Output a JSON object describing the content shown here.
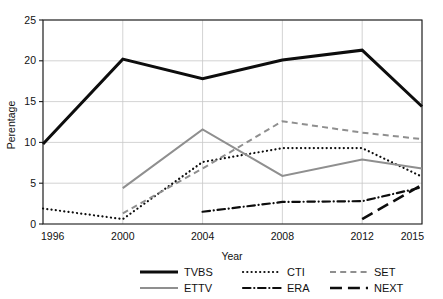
{
  "chart_data": {
    "type": "line",
    "title": "",
    "xlabel": "Year",
    "ylabel": "Perentage",
    "x": [
      1996,
      2000,
      2004,
      2008,
      2012,
      2015
    ],
    "categories": [
      "1996",
      "2000",
      "2004",
      "2008",
      "2012",
      "2015"
    ],
    "xticklabels": [
      "1996",
      "2000",
      "2004",
      "2008",
      "2012",
      "2015"
    ],
    "yticklabels": [
      "0",
      "5",
      "10",
      "15",
      "20",
      "25"
    ],
    "yticks": [
      0,
      5,
      10,
      15,
      20,
      25
    ],
    "xlim": [
      1996,
      2015
    ],
    "ylim": [
      0,
      25
    ],
    "grid": true,
    "legend_position": "below",
    "series": [
      {
        "name": "TVBS",
        "color": "#0d0d0d",
        "style": "solid",
        "width": 3.0,
        "x": [
          1996,
          2000,
          2004,
          2008,
          2012,
          2015
        ],
        "values": [
          9.8,
          20.2,
          17.8,
          20.1,
          21.3,
          14.4
        ]
      },
      {
        "name": "CTI",
        "color": "#0d0d0d",
        "style": "dotted",
        "width": 2.2,
        "x": [
          1996,
          2000,
          2004,
          2008,
          2012,
          2015
        ],
        "values": [
          1.9,
          0.6,
          7.6,
          9.3,
          9.3,
          5.8
        ]
      },
      {
        "name": "SET",
        "color": "#8f8f8f",
        "style": "dashed",
        "width": 2.0,
        "x": [
          2000,
          2004,
          2008,
          2012,
          2015
        ],
        "values": [
          1.3,
          6.8,
          12.6,
          11.2,
          10.4
        ]
      },
      {
        "name": "ETTV",
        "color": "#8f8f8f",
        "style": "solid",
        "width": 2.0,
        "x": [
          2000,
          2004,
          2008,
          2012,
          2015
        ],
        "values": [
          4.4,
          11.6,
          5.9,
          7.9,
          6.8
        ]
      },
      {
        "name": "ERA",
        "color": "#0d0d0d",
        "style": "dashdot",
        "width": 2.2,
        "x": [
          2004,
          2008,
          2012,
          2015
        ],
        "values": [
          1.5,
          2.7,
          2.8,
          4.5
        ]
      },
      {
        "name": "NEXT",
        "color": "#0d0d0d",
        "style": "longdash",
        "width": 2.6,
        "x": [
          2012,
          2015
        ],
        "values": [
          0.6,
          4.8
        ]
      }
    ]
  },
  "legend": {
    "rows": [
      [
        {
          "label": "TVBS",
          "key": "TVBS"
        },
        {
          "label": "CTI",
          "key": "CTI"
        },
        {
          "label": "SET",
          "key": "SET"
        }
      ],
      [
        {
          "label": "ETTV",
          "key": "ETTV"
        },
        {
          "label": "ERA",
          "key": "ERA"
        },
        {
          "label": "NEXT",
          "key": "NEXT"
        }
      ]
    ]
  },
  "colors": {
    "black": "#0d0d0d",
    "gray": "#8f8f8f",
    "grid": "#c8c8c8",
    "axis": "#1a1a1a",
    "background": "#ffffff"
  }
}
